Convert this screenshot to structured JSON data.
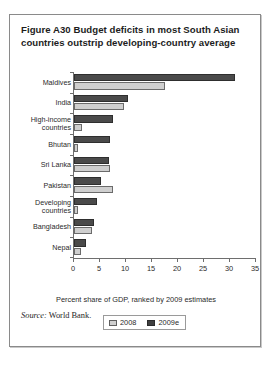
{
  "figure": {
    "title": "Figure A30  Budget deficits in most South Asian countries outstrip developing-country average",
    "source_label": "Source:",
    "source_text": " World Bank."
  },
  "legend": {
    "position": "bottom-center",
    "entries": [
      {
        "label": "2008",
        "color": "#cfcfcf"
      },
      {
        "label": "2009e",
        "color": "#3f3f3f"
      }
    ]
  },
  "axis": {
    "x_title": "Percent share of GDP, ranked by 2009 estimates",
    "x_ticks": [
      "0",
      "5",
      "10",
      "15",
      "20",
      "25",
      "30",
      "35"
    ]
  },
  "chart_data": {
    "type": "bar",
    "orientation": "horizontal",
    "title": "Figure A30  Budget deficits in most South Asian countries outstrip developing-country average",
    "xlabel": "Percent share of GDP, ranked by 2009 estimates",
    "ylabel": "",
    "xlim": [
      0,
      35
    ],
    "xticks": [
      0,
      5,
      10,
      15,
      20,
      25,
      30,
      35
    ],
    "grid": false,
    "legend_position": "bottom-center",
    "categories": [
      "Maldives",
      "India",
      "High-income countries",
      "Bhutan",
      "Sri Lanka",
      "Pakistan",
      "Developing countries",
      "Bangladesh",
      "Nepal"
    ],
    "series": [
      {
        "name": "2009e",
        "color": "#4a4a4a",
        "values": [
          31.0,
          10.4,
          7.5,
          7.0,
          6.8,
          5.2,
          4.5,
          3.8,
          2.3
        ]
      },
      {
        "name": "2008",
        "color": "#cfcfcf",
        "values": [
          17.5,
          9.6,
          1.5,
          0.7,
          7.0,
          7.5,
          0.8,
          3.5,
          1.3
        ]
      }
    ]
  }
}
